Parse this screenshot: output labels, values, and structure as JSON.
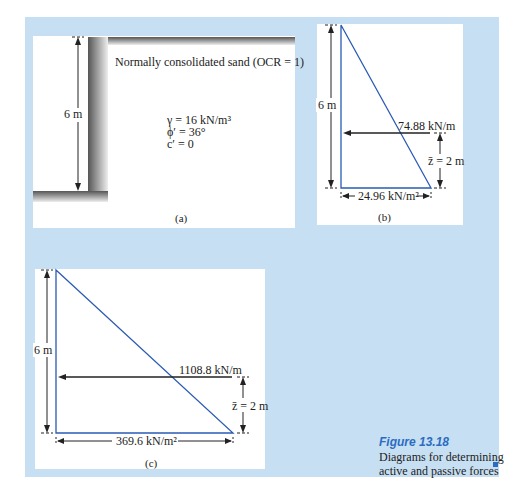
{
  "figure": {
    "number": "Figure 13.18",
    "caption": "Diagrams for determining active and passive forces",
    "accent_color": "#2a6cc2",
    "panel_bg_color": "#c7dff2"
  },
  "panel_a": {
    "label": "(a)",
    "soil_title": "Normally consolidated sand (OCR = 1)",
    "gamma": "γ = 16 kN/m³",
    "phi": "ϕ′ = 36°",
    "c": "c′ = 0",
    "height_label": "6 m"
  },
  "panel_b": {
    "label": "(b)",
    "height_label": "6 m",
    "force_label": "74.88 kN/m",
    "zbar_label": "z̄ = 2 m",
    "base_label": "24.96 kN/m²"
  },
  "panel_c": {
    "label": "(c)",
    "height_label": "6 m",
    "force_label": "1108.8 kN/m",
    "zbar_label": "z̄ = 2 m",
    "base_label": "369.6 kN/m²"
  }
}
